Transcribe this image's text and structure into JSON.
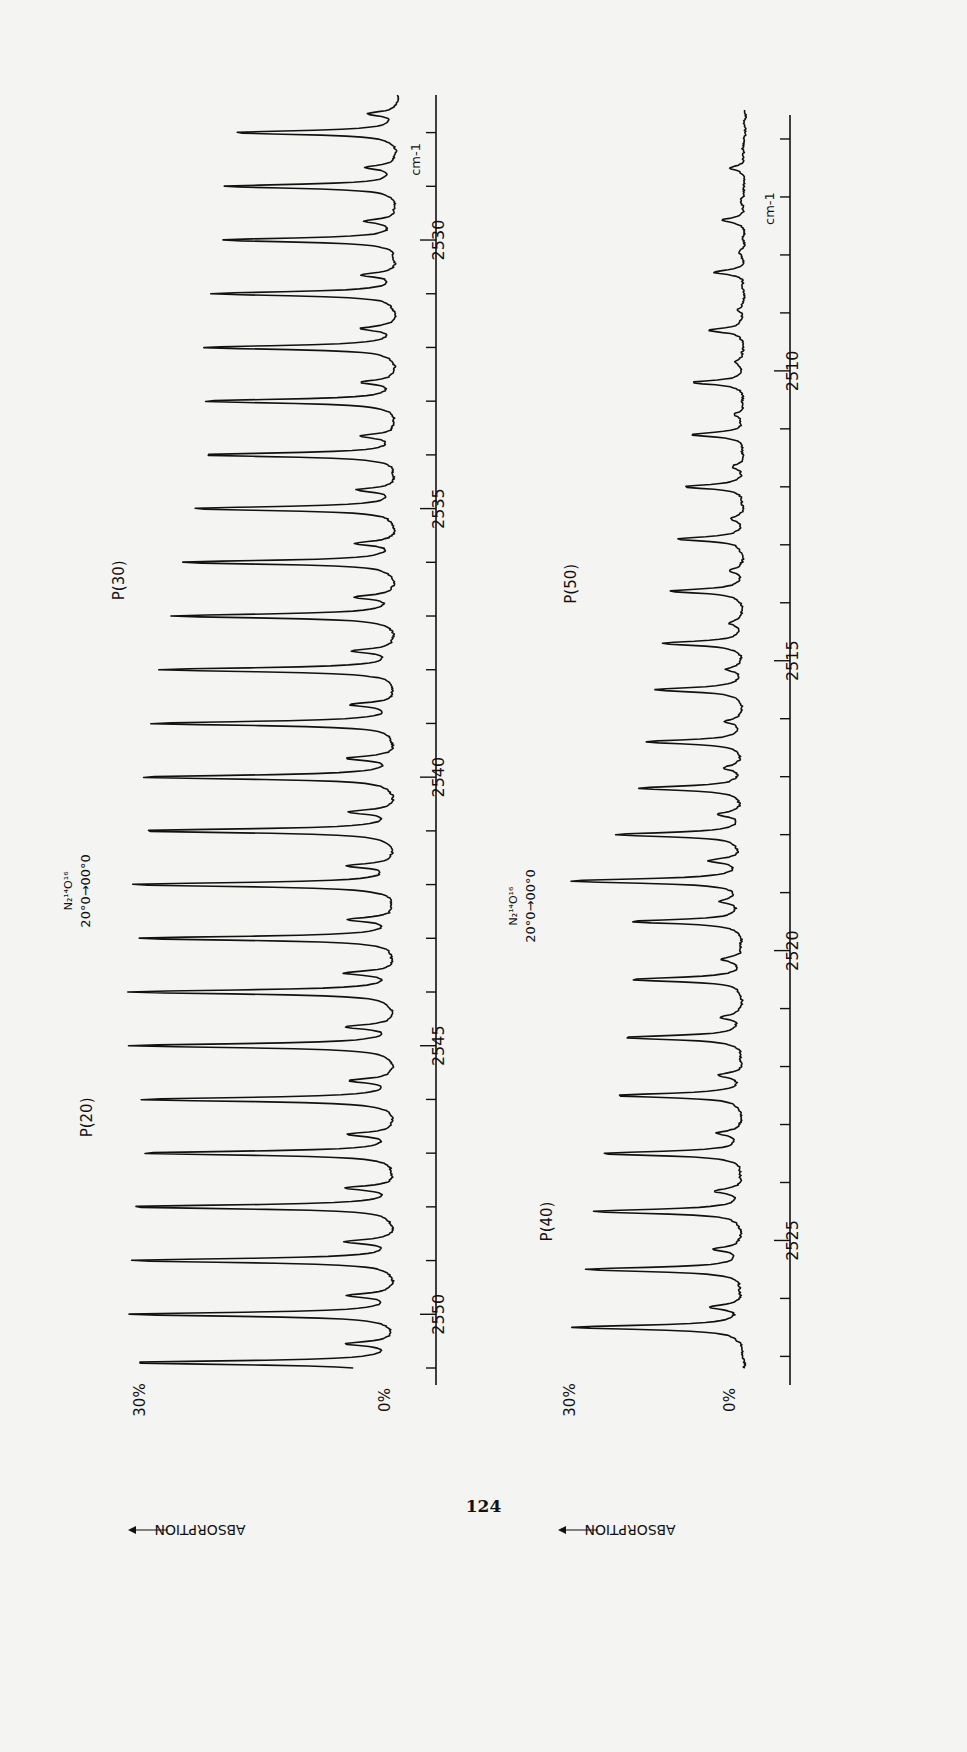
{
  "page": {
    "number": "124"
  },
  "chart_data": [
    {
      "type": "line",
      "title": "",
      "orientation": "rotated 90° (wavenumber axis runs vertically on the page)",
      "xlabel": "cm-1",
      "ylabel": "ABSORPTION",
      "y_scale_labels": [
        "30%",
        "0%"
      ],
      "ylim": [
        0,
        30
      ],
      "x_ticks": [
        2550,
        2545,
        2540,
        2535,
        2530
      ],
      "xlim": [
        2551,
        2527
      ],
      "grid": false,
      "annotations": [
        {
          "text": "P(20)",
          "at": 2546
        },
        {
          "text": "P(30)",
          "at": 2536
        },
        {
          "text": "N2 14 O 16  20°0→00°0",
          "at": 2541
        }
      ],
      "series": [
        {
          "name": "N2O absorption (panel 1)",
          "peaks_wavenumber": [
            2550.9,
            2550.0,
            2549.0,
            2548.0,
            2547.0,
            2546.0,
            2545.0,
            2544.0,
            2543.0,
            2542.0,
            2541.0,
            2540.0,
            2539.0,
            2538.0,
            2537.0,
            2536.0,
            2535.0,
            2534.0,
            2533.0,
            2532.0,
            2531.0,
            2530.0,
            2529.0,
            2528.0
          ],
          "peaks_absorption_pct": [
            26,
            26,
            26,
            26,
            25,
            25,
            26,
            26,
            25,
            26,
            25,
            25,
            24,
            23,
            22,
            21,
            20,
            19,
            19,
            19,
            18,
            17,
            17,
            16
          ]
        }
      ]
    },
    {
      "type": "line",
      "title": "",
      "orientation": "rotated 90° (wavenumber axis runs vertically on the page)",
      "xlabel": "cm-1",
      "ylabel": "ABSORPTION",
      "y_scale_labels": [
        "30%",
        "0%"
      ],
      "ylim": [
        0,
        30
      ],
      "x_ticks": [
        2525,
        2520,
        2515,
        2510
      ],
      "xlim": [
        2527,
        2505
      ],
      "grid": false,
      "annotations": [
        {
          "text": "P(40)",
          "at": 2524
        },
        {
          "text": "P(50)",
          "at": 2513.5
        },
        {
          "text": "N2 14 O 16  20°0→00°0",
          "at": 2518
        }
      ],
      "series": [
        {
          "name": "N2O absorption (panel 2)",
          "peaks_wavenumber": [
            2526.5,
            2525.5,
            2524.5,
            2523.5,
            2522.5,
            2521.5,
            2520.5,
            2519.5,
            2518.8,
            2518.0,
            2517.2,
            2516.4,
            2515.5,
            2514.7,
            2513.8,
            2512.9,
            2512.0,
            2511.1,
            2510.2,
            2509.3,
            2508.3,
            2507.4,
            2506.5
          ],
          "peaks_absorption_pct": [
            23,
            21,
            20,
            19,
            17,
            16,
            15,
            15,
            23,
            17,
            14,
            13,
            12,
            11,
            10,
            9,
            8,
            7,
            7,
            5,
            4,
            3,
            2
          ]
        }
      ]
    }
  ],
  "labels": {
    "ylabel": "ABSORPTION",
    "pct30": "30%",
    "pct0": "0%",
    "unit": "cm-1",
    "p20": "P(20)",
    "p30": "P(30)",
    "p40": "P(40)",
    "p50": "P(50)",
    "iso1": "N₂¹⁴O¹⁶",
    "iso2": "20°0→00°0",
    "ticks_top": [
      "2550",
      "2545",
      "2540",
      "2535",
      "2530"
    ],
    "ticks_bottom": [
      "2525",
      "2520",
      "2515",
      "2510"
    ]
  }
}
